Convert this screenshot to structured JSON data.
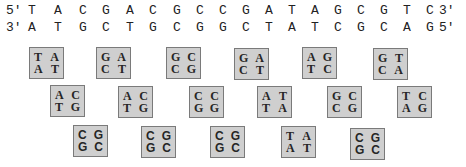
{
  "strands": {
    "top": {
      "prime_left": "5'",
      "prime_right": "3'",
      "bases": [
        "T",
        "A",
        "C",
        "G",
        "A",
        "C",
        "G",
        "C",
        "C",
        "G",
        "A",
        "T",
        "A",
        "G",
        "C",
        "G",
        "T",
        "C"
      ]
    },
    "bottom": {
      "prime_left": "3'",
      "prime_right": "5'",
      "bases": [
        "A",
        "T",
        "G",
        "C",
        "T",
        "G",
        "C",
        "G",
        "G",
        "C",
        "T",
        "A",
        "T",
        "C",
        "G",
        "C",
        "A",
        "G"
      ]
    }
  },
  "rows": [
    {
      "boxes": [
        {
          "tl": "T",
          "tr": "A",
          "bl": "A",
          "br": "T"
        },
        {
          "tl": "G",
          "tr": "A",
          "bl": "C",
          "br": "T"
        },
        {
          "tl": "G",
          "tr": "C",
          "bl": "C",
          "br": "G"
        },
        {
          "tl": "G",
          "tr": "A",
          "bl": "C",
          "br": "T"
        },
        {
          "tl": "A",
          "tr": "G",
          "bl": "T",
          "br": "C"
        },
        {
          "tl": "G",
          "tr": "T",
          "bl": "C",
          "br": "A"
        }
      ]
    },
    {
      "boxes": [
        {
          "tl": "A",
          "tr": "C",
          "bl": "T",
          "br": "G"
        },
        {
          "tl": "A",
          "tr": "C",
          "bl": "T",
          "br": "G"
        },
        {
          "tl": "C",
          "tr": "C",
          "bl": "G",
          "br": "G"
        },
        {
          "tl": "A",
          "tr": "T",
          "bl": "T",
          "br": "A"
        },
        {
          "tl": "G",
          "tr": "C",
          "bl": "C",
          "br": "G"
        },
        {
          "tl": "T",
          "tr": "C",
          "bl": "A",
          "br": "G"
        }
      ]
    },
    {
      "boxes": [
        {
          "tl": "C",
          "tr": "G",
          "bl": "G",
          "br": "C"
        },
        {
          "tl": "C",
          "tr": "G",
          "bl": "G",
          "br": "C"
        },
        {
          "tl": "C",
          "tr": "G",
          "bl": "G",
          "br": "C"
        },
        {
          "tl": "T",
          "tr": "A",
          "bl": "A",
          "br": "T"
        },
        {
          "tl": "C",
          "tr": "G",
          "bl": "G",
          "br": "C"
        }
      ]
    }
  ],
  "colors": {
    "box_fill": "#cfcfcf",
    "box_border": "#7a7a7a",
    "text": "#222222"
  }
}
